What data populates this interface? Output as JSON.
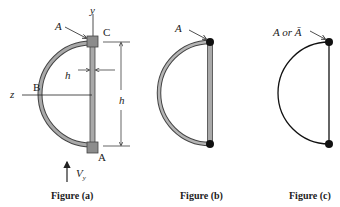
{
  "figures": [
    {
      "caption": "Figure (a)",
      "labels": {
        "area": "A",
        "y_axis": "y",
        "z_axis": "z",
        "point_c": "C",
        "point_b": "B",
        "point_a": "A",
        "thickness": "h",
        "height": "h",
        "shear_force": "V",
        "shear_subscript": "y"
      }
    },
    {
      "caption": "Figure (b)",
      "labels": {
        "area": "A"
      }
    },
    {
      "caption": "Figure (c)",
      "labels": {
        "area": "A or Ā"
      }
    }
  ],
  "colors": {
    "stroke": "#222222",
    "wall_fill": "#a9a9a9",
    "flange_fill": "#8c8c8c",
    "node": "#111111"
  }
}
